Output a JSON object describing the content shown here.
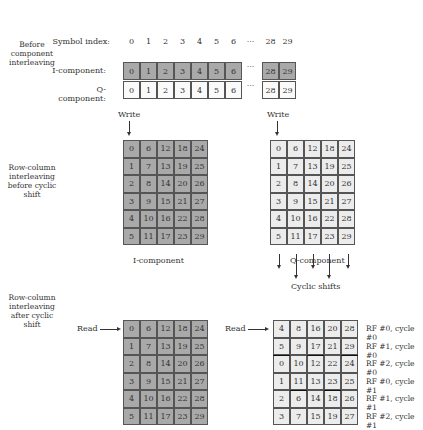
{
  "sections": {
    "before_component": "Before component interleaving",
    "before_shift": "Row-column interleaving before cyclic shift",
    "after_shift": "Row-column interleaving after cyclic shift"
  },
  "component_table": {
    "index_label": "Symbol index:",
    "indices": [
      "0",
      "1",
      "2",
      "3",
      "4",
      "5",
      "6",
      "···",
      "28",
      "29"
    ],
    "i_label": "I-component:",
    "q_label": "Q-component:",
    "i_values": [
      "0",
      "1",
      "2",
      "3",
      "4",
      "5",
      "6",
      "···",
      "28",
      "29"
    ],
    "q_values": [
      "0",
      "1",
      "2",
      "3",
      "4",
      "5",
      "6",
      "···",
      "28",
      "29"
    ]
  },
  "write_label": "Write",
  "read_label": "Read",
  "i_grid_caption": "I-component",
  "q_grid_caption": "Q-component",
  "cyclic_shifts_label": "Cyclic shifts",
  "grid_before": [
    [
      "0",
      "6",
      "12",
      "18",
      "24"
    ],
    [
      "1",
      "7",
      "13",
      "19",
      "25"
    ],
    [
      "2",
      "8",
      "14",
      "20",
      "26"
    ],
    [
      "3",
      "9",
      "15",
      "21",
      "27"
    ],
    [
      "4",
      "10",
      "16",
      "22",
      "28"
    ],
    [
      "5",
      "11",
      "17",
      "23",
      "29"
    ]
  ],
  "grid_i_after": [
    [
      "0",
      "6",
      "12",
      "18",
      "24"
    ],
    [
      "1",
      "7",
      "13",
      "19",
      "25"
    ],
    [
      "2",
      "8",
      "14",
      "20",
      "26"
    ],
    [
      "3",
      "9",
      "15",
      "21",
      "27"
    ],
    [
      "4",
      "10",
      "16",
      "22",
      "28"
    ],
    [
      "5",
      "11",
      "17",
      "23",
      "29"
    ]
  ],
  "grid_q_after": [
    [
      "4",
      "8",
      "16",
      "20",
      "28"
    ],
    [
      "5",
      "9",
      "17",
      "21",
      "29"
    ],
    [
      "0",
      "10",
      "12",
      "22",
      "24"
    ],
    [
      "1",
      "11",
      "13",
      "23",
      "25"
    ],
    [
      "2",
      "6",
      "14",
      "18",
      "26"
    ],
    [
      "3",
      "7",
      "15",
      "19",
      "27"
    ]
  ],
  "rf_labels": [
    "RF #0, cycle #0",
    "RF #1, cycle #0",
    "RF #2, cycle #0",
    "RF #0, cycle #1",
    "RF #1, cycle #1",
    "RF #2, cycle #1"
  ],
  "colors": {
    "i_cell": "#a9a9a9",
    "q_cell": "#ececec",
    "border": "#555555"
  }
}
